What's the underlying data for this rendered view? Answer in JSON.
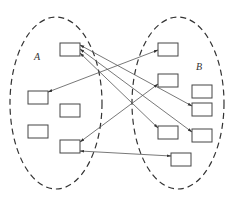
{
  "diagram": {
    "title": "",
    "sets": [
      {
        "id": "A",
        "label": "A",
        "cx": 56,
        "cy": 103,
        "rx": 46,
        "ry": 86,
        "label_x": 34,
        "label_y": 60
      },
      {
        "id": "B",
        "label": "B",
        "cx": 178,
        "cy": 103,
        "rx": 46,
        "ry": 86,
        "label_x": 196,
        "label_y": 70
      }
    ],
    "nodes": [
      {
        "id": "A1",
        "set": "A",
        "x": 60,
        "y": 43,
        "w": 20,
        "h": 13
      },
      {
        "id": "A2",
        "set": "A",
        "x": 28,
        "y": 91,
        "w": 20,
        "h": 13
      },
      {
        "id": "A3",
        "set": "A",
        "x": 60,
        "y": 104,
        "w": 20,
        "h": 13
      },
      {
        "id": "A4",
        "set": "A",
        "x": 28,
        "y": 125,
        "w": 20,
        "h": 13
      },
      {
        "id": "A5",
        "set": "A",
        "x": 60,
        "y": 140,
        "w": 20,
        "h": 13
      },
      {
        "id": "B1",
        "set": "B",
        "x": 158,
        "y": 43,
        "w": 20,
        "h": 13
      },
      {
        "id": "B2",
        "set": "B",
        "x": 158,
        "y": 74,
        "w": 20,
        "h": 13
      },
      {
        "id": "B3",
        "set": "B",
        "x": 192,
        "y": 85,
        "w": 20,
        "h": 13
      },
      {
        "id": "B4",
        "set": "B",
        "x": 192,
        "y": 103,
        "w": 20,
        "h": 13
      },
      {
        "id": "B5",
        "set": "B",
        "x": 158,
        "y": 126,
        "w": 20,
        "h": 13
      },
      {
        "id": "B6",
        "set": "B",
        "x": 192,
        "y": 129,
        "w": 20,
        "h": 13
      },
      {
        "id": "B7",
        "set": "B",
        "x": 171,
        "y": 153,
        "w": 20,
        "h": 13
      }
    ],
    "edges": [
      {
        "from": "A1",
        "to": "B4",
        "x1": 80,
        "y1": 45,
        "x2": 192,
        "y2": 106,
        "direction": "both"
      },
      {
        "from": "A1",
        "to": "B6",
        "x1": 80,
        "y1": 49,
        "x2": 192,
        "y2": 132,
        "direction": "both"
      },
      {
        "from": "A1",
        "to": "B5",
        "x1": 80,
        "y1": 53,
        "x2": 158,
        "y2": 128,
        "direction": "both"
      },
      {
        "from": "B1",
        "to": "A2",
        "x1": 158,
        "y1": 50,
        "x2": 48,
        "y2": 92,
        "direction": "both"
      },
      {
        "from": "B2",
        "to": "A5",
        "x1": 158,
        "y1": 84,
        "x2": 80,
        "y2": 142,
        "direction": "both"
      },
      {
        "from": "A5",
        "to": "B7",
        "x1": 80,
        "y1": 151,
        "x2": 171,
        "y2": 156,
        "direction": "both"
      }
    ]
  }
}
